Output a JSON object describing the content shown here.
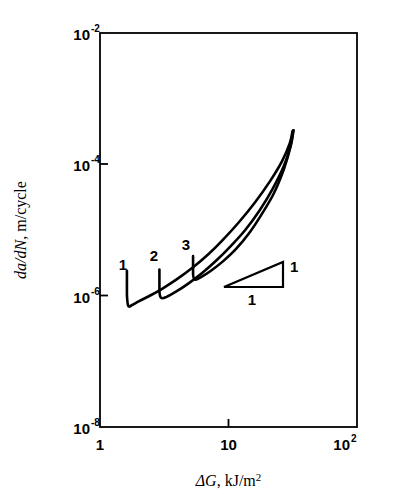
{
  "chart_data": {
    "type": "line",
    "title": "",
    "xlabel": "ΔG, kJ/m²",
    "ylabel": "da/dN, m/cycle",
    "xlabel_parts": {
      "symbol": "ΔG",
      "comma_units": ", kJ/m",
      "sup": "2"
    },
    "ylabel_parts": {
      "italic": "da/dN",
      "rest": ", m/cycle"
    },
    "xscale": "log",
    "yscale": "log",
    "xlim": [
      1,
      100
    ],
    "ylim": [
      1e-08,
      0.01
    ],
    "grid": false,
    "legend": "none",
    "xticks": [
      {
        "value": 1,
        "mantissa": "1",
        "exponent": ""
      },
      {
        "value": 10,
        "mantissa": "10",
        "exponent": ""
      },
      {
        "value": 100,
        "mantissa": "10",
        "exponent": "2"
      }
    ],
    "yticks": [
      {
        "value": 0.01,
        "mantissa": "10",
        "exponent": "-2"
      },
      {
        "value": 0.0001,
        "mantissa": "10",
        "exponent": "-4"
      },
      {
        "value": 1e-06,
        "mantissa": "10",
        "exponent": "-6"
      },
      {
        "value": 1e-08,
        "mantissa": "10",
        "exponent": "-8"
      }
    ],
    "annotations": [
      {
        "name": "slope-triangle",
        "rise_label": "1",
        "run_label": "1",
        "slope": 1
      }
    ],
    "series": [
      {
        "name": "1",
        "label": "1",
        "threshold_dG": 1.62,
        "points": [
          [
            1.62,
            2.4e-06
          ],
          [
            1.62,
            1.05e-06
          ],
          [
            1.66,
            7e-07
          ],
          [
            1.78,
            7.2e-07
          ],
          [
            2.0,
            8.2e-07
          ],
          [
            2.4,
            9.8e-07
          ],
          [
            3.0,
            1.25e-06
          ],
          [
            4.0,
            1.8e-06
          ],
          [
            5.3,
            2.7e-06
          ],
          [
            7.0,
            4.3e-06
          ],
          [
            9.0,
            7e-06
          ],
          [
            12.0,
            1.3e-05
          ],
          [
            16.0,
            2.6e-05
          ],
          [
            21.0,
            5.5e-05
          ],
          [
            26.0,
            0.00011
          ],
          [
            30.0,
            0.00021
          ],
          [
            31.5,
            0.00032
          ]
        ]
      },
      {
        "name": "2",
        "label": "2",
        "threshold_dG": 2.9,
        "points": [
          [
            2.9,
            2.5e-06
          ],
          [
            2.9,
            1.15e-06
          ],
          [
            3.0,
            9.2e-07
          ],
          [
            3.3,
            9.6e-07
          ],
          [
            3.9,
            1.15e-06
          ],
          [
            4.8,
            1.5e-06
          ],
          [
            6.2,
            2.2e-06
          ],
          [
            8.0,
            3.4e-06
          ],
          [
            10.5,
            5.8e-06
          ],
          [
            13.5,
            1e-05
          ],
          [
            17.5,
            2e-05
          ],
          [
            22.0,
            4.2e-05
          ],
          [
            27.0,
            9.5e-05
          ],
          [
            30.5,
            0.0002
          ],
          [
            32.0,
            0.00033
          ]
        ]
      },
      {
        "name": "3",
        "label": "3",
        "threshold_dG": 5.3,
        "points": [
          [
            5.3,
            4e-06
          ],
          [
            5.3,
            2.1e-06
          ],
          [
            5.5,
            1.75e-06
          ],
          [
            6.2,
            1.95e-06
          ],
          [
            7.3,
            2.4e-06
          ],
          [
            9.0,
            3.3e-06
          ],
          [
            11.5,
            5.2e-06
          ],
          [
            14.5,
            9e-06
          ],
          [
            18.0,
            1.7e-05
          ],
          [
            22.5,
            3.6e-05
          ],
          [
            27.0,
            8.5e-05
          ],
          [
            30.5,
            0.00019
          ],
          [
            32.0,
            0.00033
          ]
        ]
      }
    ]
  }
}
